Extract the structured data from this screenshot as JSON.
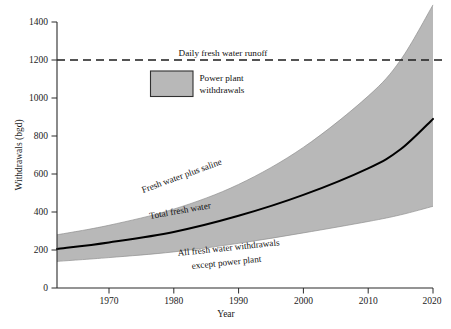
{
  "chart_data": {
    "type": "area",
    "title": "",
    "xlabel": "Year",
    "ylabel": "Withdrawals (bgd)",
    "xlim": [
      1962,
      2020
    ],
    "ylim": [
      0,
      1400
    ],
    "grid": false,
    "legend_position": "inside-upper-left",
    "x_ticks": [
      "1970",
      "1980",
      "1990",
      "2000",
      "2010",
      "2020"
    ],
    "x_tick_values": [
      1970,
      1980,
      1990,
      2000,
      2010,
      2020
    ],
    "y_ticks": [
      "0",
      "200",
      "400",
      "600",
      "800",
      "1000",
      "1200",
      "1400"
    ],
    "y_tick_values": [
      0,
      200,
      400,
      600,
      800,
      1000,
      1200,
      1400
    ],
    "x": [
      1962,
      1970,
      1980,
      1990,
      2000,
      2010,
      2015,
      2020
    ],
    "series": [
      {
        "name": "Fresh water plus saline",
        "role": "band-upper",
        "values": [
          280,
          330,
          415,
          545,
          740,
          1010,
          1200,
          1490
        ]
      },
      {
        "name": "Total fresh water",
        "role": "line",
        "values": [
          205,
          240,
          295,
          380,
          490,
          630,
          730,
          890
        ]
      },
      {
        "name": "All fresh water withdrawals except power plant",
        "role": "band-lower",
        "values": [
          140,
          160,
          190,
          235,
          290,
          350,
          385,
          430
        ]
      },
      {
        "name": "Daily fresh water runoff",
        "role": "reference-line",
        "value": 1200
      }
    ],
    "annotations": [
      {
        "key": "runoff",
        "text": "Daily fresh water runoff"
      },
      {
        "key": "upper",
        "text": "Fresh water plus saline"
      },
      {
        "key": "mid",
        "text": "Total fresh water"
      },
      {
        "key": "lower_line1",
        "text": "All fresh water withdrawals"
      },
      {
        "key": "lower_line2",
        "text": "except power plant"
      }
    ],
    "legend": [
      {
        "label_line1": "Power plant",
        "label_line2": "withdrawals",
        "swatch_color": "#b8b8b8"
      }
    ],
    "colors": {
      "band": "#b8b8b8",
      "curve": "#000000",
      "axis": "#2b2b2b",
      "background": "#ffffff"
    }
  }
}
